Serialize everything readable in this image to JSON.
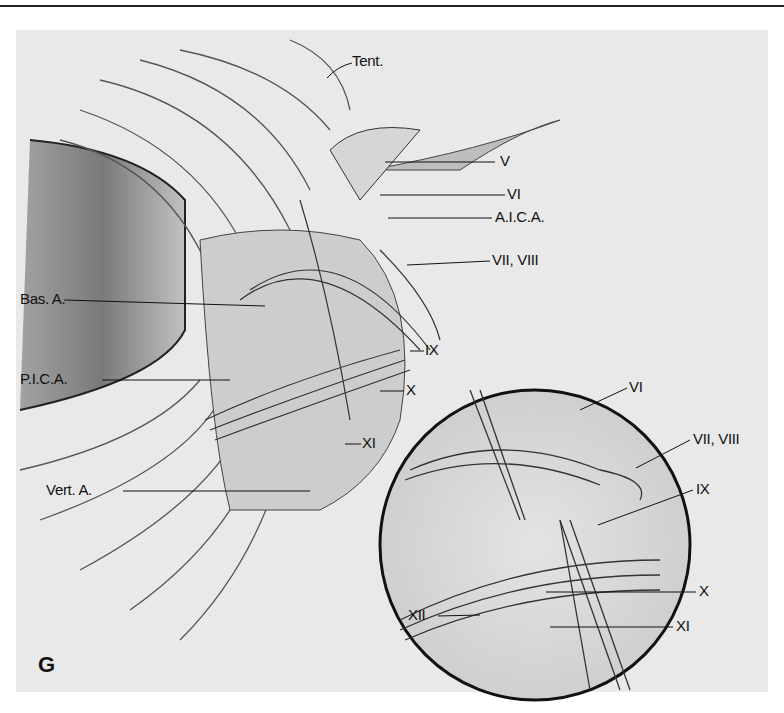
{
  "figure": {
    "panel_letter": "G",
    "main_labels": {
      "tent": "Tent.",
      "v": "V",
      "vi": "VI",
      "aica": "A.I.C.A.",
      "vii_viii": "VII, VIII",
      "bas_a": "Bas. A.",
      "ix": "IX",
      "pica": "P.I.C.A.",
      "x": "X",
      "xi": "XI",
      "vert_a": "Vert. A."
    },
    "inset_labels": {
      "vi": "VI",
      "vii_viii": "VII, VIII",
      "ix": "IX",
      "x": "X",
      "xii": "XII",
      "xi": "XI"
    }
  }
}
